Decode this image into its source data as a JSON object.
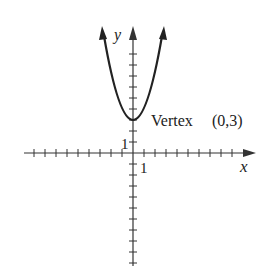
{
  "figure": {
    "function": "y = x^2 + 3",
    "axis_labels": {
      "x": "x",
      "y": "y"
    },
    "tick_labels": {
      "x_unit": "1",
      "y_unit": "1"
    },
    "annotation": {
      "label": "Vertex",
      "point": "(0,3)"
    },
    "vertex": [
      0,
      3
    ],
    "x_range": [
      -10,
      10
    ],
    "y_range": [
      -10,
      11
    ],
    "colors": {
      "curve": "#222222",
      "axis": "#333333"
    }
  }
}
